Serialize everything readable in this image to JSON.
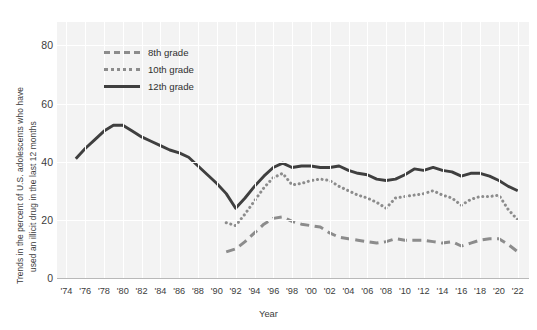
{
  "axes": {
    "ylabel_line1": "Trends in the percent of U.S. adolescents  who have",
    "ylabel_line2": "used an illicit drug in the last 12 months",
    "xlabel": "Year",
    "yticks": [
      "0",
      "20",
      "40",
      "60",
      "80"
    ],
    "xticks": [
      "'74",
      "'76",
      "'78",
      "'80",
      "'82",
      "'84",
      "'86",
      "'88",
      "'90",
      "'92",
      "'94",
      "'96",
      "'98",
      "'00",
      "'02",
      "'04",
      "'06",
      "'08",
      "'10",
      "'12",
      "'14",
      "'16",
      "'18",
      "'20",
      "'22"
    ]
  },
  "legend": {
    "items": [
      {
        "label": "8th grade",
        "style": "dashed",
        "color": "#8c8c8c"
      },
      {
        "label": "10th grade",
        "style": "dotted",
        "color": "#8c8c8c"
      },
      {
        "label": "12th grade",
        "style": "solid",
        "color": "#3f3f3f"
      }
    ]
  },
  "colors": {
    "plot_background": "#f3f3f3",
    "gridline": "#ffffff",
    "axis_line": "#b8b8b8",
    "text": "#3c3c3c",
    "series_12th": "#3f3f3f",
    "series_10th": "#8c8c8c",
    "series_8th": "#8c8c8c"
  },
  "chart_data": {
    "type": "line",
    "title": "",
    "xlabel": "Year",
    "ylabel": "Trends in the percent of U.S. adolescents  who have used an illicit drug in the last 12 months",
    "xlim": [
      1973,
      1973
    ],
    "ylim": [
      0,
      88
    ],
    "grid": true,
    "legend_position": "upper-left",
    "series": [
      {
        "name": "12th grade",
        "style": "solid",
        "color": "#3f3f3f",
        "x": [
          1975,
          1976,
          1977,
          1978,
          1979,
          1980,
          1981,
          1982,
          1983,
          1984,
          1985,
          1986,
          1987,
          1988,
          1989,
          1990,
          1991,
          1992,
          1993,
          1994,
          1995,
          1996,
          1997,
          1998,
          1999,
          2000,
          2001,
          2002,
          2003,
          2004,
          2005,
          2006,
          2007,
          2008,
          2009,
          2010,
          2011,
          2012,
          2013,
          2014,
          2015,
          2016,
          2017,
          2018,
          2019,
          2020,
          2021,
          2022
        ],
        "values": [
          41.0,
          44.5,
          47.5,
          50.5,
          52.5,
          52.5,
          50.5,
          48.5,
          47.0,
          45.5,
          44.0,
          43.0,
          41.5,
          38.5,
          35.5,
          32.5,
          29.0,
          24.0,
          27.5,
          31.5,
          35.0,
          38.0,
          39.5,
          38.0,
          38.5,
          38.5,
          38.0,
          38.0,
          38.5,
          37.0,
          36.0,
          35.5,
          34.0,
          33.5,
          34.0,
          35.5,
          37.5,
          37.0,
          38.0,
          37.0,
          36.5,
          35.0,
          36.0,
          36.0,
          35.0,
          33.5,
          31.5,
          30.0
        ]
      },
      {
        "name": "10th grade",
        "style": "dotted",
        "color": "#8c8c8c",
        "x": [
          1991,
          1992,
          1993,
          1994,
          1995,
          1996,
          1997,
          1998,
          1999,
          2000,
          2001,
          2002,
          2003,
          2004,
          2005,
          2006,
          2007,
          2008,
          2009,
          2010,
          2011,
          2012,
          2013,
          2014,
          2015,
          2016,
          2017,
          2018,
          2019,
          2020,
          2021,
          2022
        ],
        "values": [
          19.0,
          18.0,
          22.0,
          26.5,
          31.0,
          34.5,
          36.0,
          32.0,
          32.5,
          33.5,
          34.0,
          33.5,
          31.5,
          30.0,
          28.5,
          27.5,
          26.0,
          24.0,
          27.5,
          28.0,
          28.5,
          29.0,
          30.0,
          28.5,
          27.5,
          25.0,
          27.0,
          28.0,
          28.0,
          28.5,
          23.5,
          20.0
        ]
      },
      {
        "name": "8th grade",
        "style": "dashed",
        "color": "#8c8c8c",
        "x": [
          1991,
          1992,
          1993,
          1994,
          1995,
          1996,
          1997,
          1998,
          1999,
          2000,
          2001,
          2002,
          2003,
          2004,
          2005,
          2006,
          2007,
          2008,
          2009,
          2010,
          2011,
          2012,
          2013,
          2014,
          2015,
          2016,
          2017,
          2018,
          2019,
          2020,
          2021,
          2022
        ],
        "values": [
          9.0,
          10.0,
          12.5,
          15.5,
          18.5,
          20.5,
          21.0,
          19.5,
          18.5,
          18.0,
          17.5,
          15.5,
          14.0,
          13.5,
          13.0,
          12.5,
          12.0,
          12.5,
          13.5,
          13.0,
          13.0,
          13.0,
          12.5,
          12.0,
          12.5,
          11.0,
          12.0,
          13.0,
          13.5,
          13.5,
          11.5,
          9.0
        ]
      }
    ]
  }
}
